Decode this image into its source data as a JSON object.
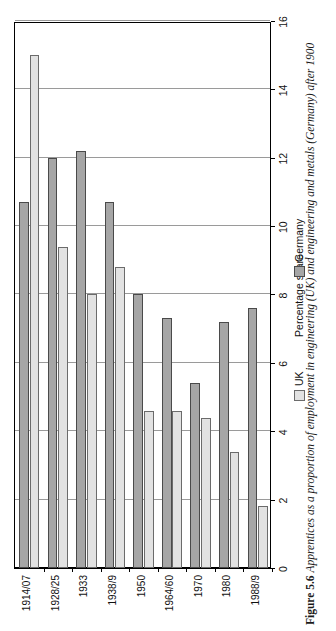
{
  "figure": {
    "number": "Figure 5.6",
    "caption": "Apprentices as a proportion of employment in engineering (UK) and engineering and metals (Germany) after 1900"
  },
  "legend": {
    "position": "below-plot",
    "items": [
      {
        "label": "UK",
        "color": "#e2e2e2"
      },
      {
        "label": "Germany",
        "color": "#a6a6a6"
      }
    ]
  },
  "axis": {
    "value_title": "Percentage share",
    "ticks": [
      "16",
      "14",
      "12",
      "10",
      "8",
      "6",
      "4",
      "2",
      "0"
    ]
  },
  "chart_data": {
    "type": "bar",
    "orientation": "vertical-printed-sideways",
    "title": "",
    "xlabel": "",
    "ylabel": "Percentage share",
    "ylim": [
      0,
      16
    ],
    "grid": true,
    "legend_position": "below",
    "categories": [
      "1914/07",
      "1928/25",
      "1933",
      "1938/9",
      "1950",
      "1964/60",
      "1970",
      "1980",
      "1988/9"
    ],
    "series": [
      {
        "name": "UK",
        "color": "#e2e2e2",
        "values": [
          15.0,
          9.4,
          8.0,
          8.8,
          4.6,
          4.6,
          4.4,
          3.4,
          1.8
        ]
      },
      {
        "name": "Germany",
        "color": "#a6a6a6",
        "values": [
          10.7,
          12.0,
          12.2,
          10.7,
          8.0,
          7.3,
          5.4,
          7.2,
          7.6
        ]
      }
    ]
  }
}
